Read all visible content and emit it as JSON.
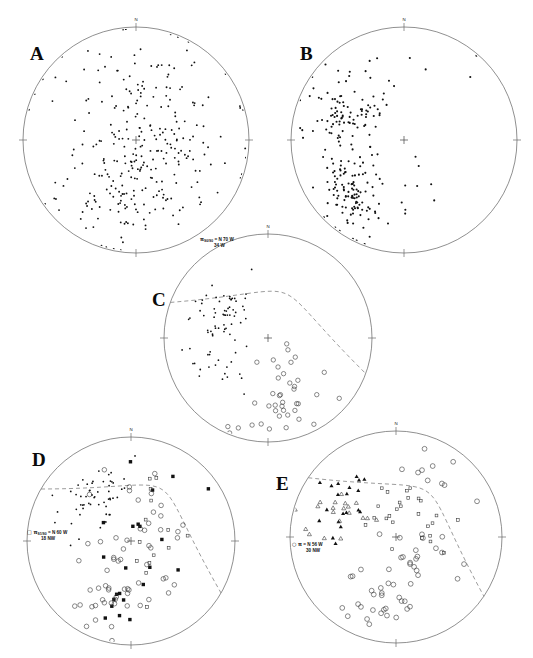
{
  "figure": {
    "type": "stereonet-plate",
    "panel_count": 5,
    "background_color": "#ffffff",
    "line_color": "#6b6b6b",
    "symbol_color": "#111111",
    "dashed_color": "#8a8a8a"
  },
  "panels": [
    {
      "id": "A",
      "letter": "A",
      "letter_pos": {
        "x": 30,
        "y": 44
      },
      "center": {
        "x": 136,
        "y": 140
      },
      "radius": 113,
      "cardinals": [
        {
          "label": "N",
          "angle": 0
        },
        {
          "label": "E",
          "angle": 90
        },
        {
          "label": "S",
          "angle": 180
        },
        {
          "label": "W",
          "angle": 270
        }
      ],
      "has_center_cross": true,
      "great_circles": [],
      "annotation": null,
      "series": [
        {
          "name": "poles-to-foliation",
          "symbol": "filled-dot",
          "size": 1.7,
          "count": 300,
          "seed": 17,
          "clusters": [
            {
              "cx": 0.06,
              "cy": -0.05,
              "sx": 0.4,
              "sy": 0.34,
              "n": 120,
              "rot": -0.55
            },
            {
              "cx": -0.18,
              "cy": 0.52,
              "sx": 0.26,
              "sy": 0.18,
              "n": 70,
              "rot": -0.5
            },
            {
              "cx": 0.3,
              "cy": 0.22,
              "sx": 0.26,
              "sy": 0.24,
              "n": 55,
              "rot": -0.4
            },
            {
              "cx": -0.02,
              "cy": -0.48,
              "sx": 0.34,
              "sy": 0.2,
              "n": 30,
              "rot": -0.3
            },
            {
              "cx": 0.02,
              "cy": 0.02,
              "sx": 0.72,
              "sy": 0.7,
              "n": 25,
              "rot": 0.0
            }
          ]
        }
      ]
    },
    {
      "id": "B",
      "letter": "B",
      "letter_pos": {
        "x": 300,
        "y": 44
      },
      "center": {
        "x": 404,
        "y": 140
      },
      "radius": 113,
      "cardinals": [
        {
          "label": "N",
          "angle": 0
        },
        {
          "label": "E",
          "angle": 90
        },
        {
          "label": "S",
          "angle": 180
        },
        {
          "label": "W",
          "angle": 270
        }
      ],
      "has_center_cross": true,
      "great_circles": [],
      "annotation": null,
      "series": [
        {
          "name": "poles-to-bedding",
          "symbol": "filled-dot",
          "size": 1.9,
          "count": 230,
          "seed": 41,
          "clusters": [
            {
              "cx": -0.52,
              "cy": -0.22,
              "sx": 0.19,
              "sy": 0.17,
              "n": 85,
              "rot": -0.5
            },
            {
              "cx": -0.47,
              "cy": 0.46,
              "sx": 0.13,
              "sy": 0.13,
              "n": 80,
              "rot": -0.4
            },
            {
              "cx": -0.5,
              "cy": 0.13,
              "sx": 0.18,
              "sy": 0.26,
              "n": 28,
              "rot": 0.0
            },
            {
              "cx": -0.25,
              "cy": 0.1,
              "sx": 0.22,
              "sy": 0.32,
              "n": 20,
              "rot": -0.3
            },
            {
              "cx": -0.05,
              "cy": -0.7,
              "sx": 0.45,
              "sy": 0.1,
              "n": 10,
              "rot": 0.0
            },
            {
              "cx": -0.28,
              "cy": 0.72,
              "sx": 0.28,
              "sy": 0.12,
              "n": 12,
              "rot": -0.2
            }
          ]
        }
      ]
    },
    {
      "id": "C",
      "letter": "C",
      "letter_pos": {
        "x": 152,
        "y": 290
      },
      "center": {
        "x": 268,
        "y": 338
      },
      "radius": 104,
      "cardinals": [
        {
          "label": "N",
          "angle": 0
        },
        {
          "label": "E",
          "angle": 90
        },
        {
          "label": "S",
          "angle": 180
        },
        {
          "label": "W",
          "angle": 270
        }
      ],
      "has_center_cross": true,
      "great_circles": [
        {
          "style": "dashed",
          "strike_deg": 290,
          "dip_deg": 34,
          "dip_dir": "W",
          "bulge": 0.46
        }
      ],
      "annotation": {
        "pi_symbol": "π",
        "sub": "S0/S0",
        "equals": "=",
        "line1": "N 70 W",
        "line2": "34 W",
        "pos": {
          "x": 200,
          "y": 236
        }
      },
      "series": [
        {
          "name": "poles-cluster",
          "symbol": "filled-dot",
          "size": 1.6,
          "count": 78,
          "seed": 7,
          "clusters": [
            {
              "cx": -0.45,
              "cy": -0.26,
              "sx": 0.14,
              "sy": 0.12,
              "n": 48,
              "rot": -0.4
            },
            {
              "cx": -0.5,
              "cy": 0.08,
              "sx": 0.16,
              "sy": 0.12,
              "n": 16,
              "rot": 0.0
            },
            {
              "cx": -0.38,
              "cy": 0.3,
              "sx": 0.16,
              "sy": 0.14,
              "n": 14,
              "rot": 0.0
            }
          ]
        },
        {
          "name": "girdle-points",
          "symbol": "open-circle",
          "size": 2.2,
          "count": 40,
          "seed": 23,
          "clusters": [
            {
              "cx": 0.22,
              "cy": 0.46,
              "sx": 0.16,
              "sy": 0.22,
              "n": 24,
              "rot": -0.7
            },
            {
              "cx": 0.02,
              "cy": 0.72,
              "sx": 0.18,
              "sy": 0.1,
              "n": 16,
              "rot": -0.4
            }
          ]
        }
      ]
    },
    {
      "id": "D",
      "letter": "D",
      "letter_pos": {
        "x": 32,
        "y": 450
      },
      "center": {
        "x": 131,
        "y": 541
      },
      "radius": 104,
      "cardinals": [
        {
          "label": "N",
          "angle": 0
        },
        {
          "label": "E",
          "angle": 90
        },
        {
          "label": "S",
          "angle": 180
        },
        {
          "label": "W",
          "angle": 270
        }
      ],
      "has_center_cross": true,
      "great_circles": [
        {
          "style": "dashed",
          "strike_deg": 300,
          "dip_deg": 18,
          "dip_dir": "NW",
          "bulge": 0.58
        }
      ],
      "annotation": {
        "pi_symbol": "π",
        "sub": "S1/S0",
        "equals": "=",
        "line1": "N 60 W",
        "line2": "18 NW",
        "pos": {
          "x": 27,
          "y": 529
        },
        "key_symbol": "open-square"
      },
      "series": [
        {
          "name": "poles-filled-square",
          "symbol": "filled-square",
          "size": 3.4,
          "count": 22,
          "seed": 53,
          "clusters": [
            {
              "cx": 0.3,
              "cy": -0.62,
              "sx": 0.26,
              "sy": 0.12,
              "n": 4,
              "rot": 0.0
            },
            {
              "cx": 0.16,
              "cy": -0.12,
              "sx": 0.16,
              "sy": 0.22,
              "n": 5,
              "rot": -0.6
            },
            {
              "cx": -0.06,
              "cy": 0.34,
              "sx": 0.18,
              "sy": 0.22,
              "n": 8,
              "rot": -0.6
            },
            {
              "cx": -0.26,
              "cy": 0.62,
              "sx": 0.12,
              "sy": 0.1,
              "n": 5,
              "rot": 0.0
            }
          ]
        },
        {
          "name": "poles-small-dot",
          "symbol": "filled-dot",
          "size": 1.6,
          "count": 55,
          "seed": 61,
          "clusters": [
            {
              "cx": -0.4,
              "cy": -0.36,
              "sx": 0.18,
              "sy": 0.14,
              "n": 40,
              "rot": -0.4
            },
            {
              "cx": -0.24,
              "cy": -0.52,
              "sx": 0.14,
              "sy": 0.1,
              "n": 15,
              "rot": 0.0
            }
          ]
        },
        {
          "name": "girdle-open-symbols",
          "symbol": "open-circle",
          "size": 2.3,
          "count": 62,
          "seed": 89,
          "clusters": [
            {
              "cx": 0.22,
              "cy": -0.28,
              "sx": 0.14,
              "sy": 0.3,
              "n": 16,
              "rot": -0.7
            },
            {
              "cx": 0.04,
              "cy": 0.3,
              "sx": 0.2,
              "sy": 0.22,
              "n": 26,
              "rot": -0.7
            },
            {
              "cx": -0.24,
              "cy": 0.6,
              "sx": 0.16,
              "sy": 0.14,
              "n": 20,
              "rot": -0.4
            }
          ]
        },
        {
          "name": "open-square-set",
          "symbol": "open-square",
          "size": 2.8,
          "count": 14,
          "seed": 97,
          "clusters": [
            {
              "cx": 0.26,
              "cy": -0.4,
              "sx": 0.12,
              "sy": 0.26,
              "n": 7,
              "rot": -0.7
            },
            {
              "cx": 0.06,
              "cy": 0.18,
              "sx": 0.14,
              "sy": 0.18,
              "n": 7,
              "rot": -0.5
            }
          ]
        }
      ]
    },
    {
      "id": "E",
      "letter": "E",
      "letter_pos": {
        "x": 276,
        "y": 474
      },
      "center": {
        "x": 396,
        "y": 537
      },
      "radius": 106,
      "cardinals": [
        {
          "label": "N",
          "angle": 0
        },
        {
          "label": "E",
          "angle": 90
        },
        {
          "label": "S",
          "angle": 180
        },
        {
          "label": "W",
          "angle": 270
        }
      ],
      "has_center_cross": true,
      "great_circles": [
        {
          "style": "dashed",
          "strike_deg": 304,
          "dip_deg": 30,
          "dip_dir": "NW",
          "bulge": 0.52
        }
      ],
      "annotation": {
        "pi_symbol": "π",
        "sub": "",
        "equals": "=",
        "line1": "N 56 W",
        "line2": "30 NW",
        "pos": {
          "x": 292,
          "y": 541
        },
        "key_symbol": "open-circle"
      },
      "series": [
        {
          "name": "lineations-filled-triangle",
          "symbol": "filled-triangle",
          "size": 3.3,
          "count": 20,
          "seed": 13,
          "clusters": [
            {
              "cx": -0.42,
              "cy": -0.42,
              "sx": 0.14,
              "sy": 0.1,
              "n": 12,
              "rot": -0.3
            },
            {
              "cx": -0.5,
              "cy": -0.2,
              "sx": 0.12,
              "sy": 0.1,
              "n": 8,
              "rot": 0.0
            }
          ]
        },
        {
          "name": "lineations-open-triangle",
          "symbol": "open-triangle",
          "size": 3.3,
          "count": 20,
          "seed": 29,
          "clusters": [
            {
              "cx": -0.46,
              "cy": -0.28,
              "sx": 0.18,
              "sy": 0.14,
              "n": 14,
              "rot": -0.3
            },
            {
              "cx": -0.58,
              "cy": -0.12,
              "sx": 0.12,
              "sy": 0.1,
              "n": 6,
              "rot": 0.0
            }
          ]
        },
        {
          "name": "poles-open-square",
          "symbol": "open-square",
          "size": 2.7,
          "count": 26,
          "seed": 71,
          "clusters": [
            {
              "cx": -0.06,
              "cy": -0.28,
              "sx": 0.12,
              "sy": 0.14,
              "n": 12,
              "rot": 0.0
            },
            {
              "cx": 0.24,
              "cy": -0.22,
              "sx": 0.14,
              "sy": 0.2,
              "n": 8,
              "rot": -0.4
            },
            {
              "cx": 0.3,
              "cy": -0.04,
              "sx": 0.12,
              "sy": 0.12,
              "n": 6,
              "rot": 0.0
            }
          ]
        },
        {
          "name": "girdle-open-circle",
          "symbol": "open-circle",
          "size": 2.4,
          "count": 58,
          "seed": 103,
          "clusters": [
            {
              "cx": 0.38,
              "cy": -0.56,
              "sx": 0.14,
              "sy": 0.14,
              "n": 10,
              "rot": 0.0
            },
            {
              "cx": 0.3,
              "cy": 0.12,
              "sx": 0.14,
              "sy": 0.24,
              "n": 12,
              "rot": -0.6
            },
            {
              "cx": 0.06,
              "cy": 0.52,
              "sx": 0.22,
              "sy": 0.16,
              "n": 20,
              "rot": -0.4
            },
            {
              "cx": -0.22,
              "cy": 0.66,
              "sx": 0.18,
              "sy": 0.12,
              "n": 16,
              "rot": -0.3
            }
          ]
        }
      ]
    }
  ]
}
